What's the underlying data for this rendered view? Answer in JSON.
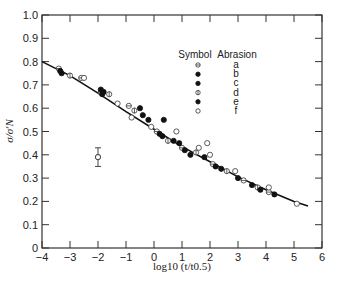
{
  "chart_data": {
    "type": "scatter",
    "title": "",
    "xlabel": "log10 (t/t0.5)",
    "ylabel": "σ/σ'N",
    "xlim": [
      -4,
      6
    ],
    "ylim": [
      0,
      1.0
    ],
    "grid": false,
    "x_ticks": [
      -4,
      -3,
      -2,
      -1,
      0,
      1,
      2,
      3,
      4,
      5,
      6
    ],
    "x_tick_labels": [
      "−4",
      "−3",
      "−2",
      "−1",
      "0",
      "1",
      "2",
      "3",
      "4",
      "5",
      "6"
    ],
    "y_ticks": [
      0,
      0.1,
      0.2,
      0.3,
      0.4,
      0.5,
      0.6,
      0.7,
      0.8,
      0.9,
      1.0
    ],
    "y_tick_labels": [
      "0",
      "0.1",
      "0.2",
      "0.3",
      "0.4",
      "0.5",
      "0.6",
      "0.7",
      "0.8",
      "0.9",
      "1.0"
    ],
    "legend": {
      "position": "upper right",
      "headers": [
        "Symbol",
        "Abrasion"
      ],
      "entries": [
        {
          "symbol": "circle-hbar",
          "label": "a"
        },
        {
          "symbol": "filled-circle",
          "label": "b"
        },
        {
          "symbol": "filled-circle",
          "label": "c"
        },
        {
          "symbol": "circle-vbar",
          "label": "d"
        },
        {
          "symbol": "filled-circle",
          "label": "e"
        },
        {
          "symbol": "open-circle",
          "label": "f"
        }
      ]
    },
    "fit_curve": {
      "x": [
        -4,
        -3,
        -2,
        -1,
        0,
        1,
        2,
        3,
        4,
        5,
        5.5
      ],
      "y": [
        0.8,
        0.74,
        0.665,
        0.585,
        0.51,
        0.435,
        0.37,
        0.305,
        0.25,
        0.2,
        0.18
      ]
    },
    "series": [
      {
        "name": "a",
        "symbol": "circle-hbar",
        "points": [
          [
            -3.4,
            0.77
          ],
          [
            -2.6,
            0.73
          ],
          [
            -1.9,
            0.67
          ],
          [
            -0.9,
            0.61
          ],
          [
            0.1,
            0.5
          ],
          [
            1.0,
            0.43
          ],
          [
            2.1,
            0.36
          ],
          [
            3.2,
            0.29
          ],
          [
            4.1,
            0.24
          ]
        ]
      },
      {
        "name": "b",
        "symbol": "filled-circle",
        "points": [
          [
            -3.3,
            0.75
          ],
          [
            -1.8,
            0.67
          ],
          [
            -0.5,
            0.6
          ],
          [
            0.2,
            0.49
          ],
          [
            0.9,
            0.45
          ],
          [
            2.2,
            0.35
          ],
          [
            3.0,
            0.3
          ],
          [
            4.3,
            0.23
          ]
        ]
      },
      {
        "name": "c",
        "symbol": "filled-circle",
        "points": [
          [
            -3.35,
            0.76
          ],
          [
            -1.85,
            0.66
          ],
          [
            -0.2,
            0.55
          ],
          [
            0.3,
            0.48
          ],
          [
            1.1,
            0.42
          ],
          [
            1.8,
            0.39
          ],
          [
            3.5,
            0.27
          ]
        ]
      },
      {
        "name": "d",
        "symbol": "circle-vbar",
        "points": [
          [
            -3.0,
            0.74
          ],
          [
            -1.6,
            0.66
          ],
          [
            -0.7,
            0.59
          ],
          [
            0.5,
            0.46
          ],
          [
            1.5,
            0.41
          ],
          [
            2.6,
            0.33
          ],
          [
            3.7,
            0.26
          ]
        ]
      },
      {
        "name": "e",
        "symbol": "filled-circle",
        "points": [
          [
            -1.9,
            0.68
          ],
          [
            -0.4,
            0.57
          ],
          [
            0.35,
            0.55
          ],
          [
            0.7,
            0.46
          ],
          [
            1.3,
            0.4
          ],
          [
            2.4,
            0.34
          ],
          [
            3.8,
            0.25
          ]
        ]
      },
      {
        "name": "f",
        "symbol": "open-circle",
        "points": [
          [
            -2.0,
            0.39
          ],
          [
            -2.5,
            0.73
          ],
          [
            -1.3,
            0.62
          ],
          [
            -0.8,
            0.56
          ],
          [
            -0.1,
            0.52
          ],
          [
            0.8,
            0.5
          ],
          [
            1.6,
            0.43
          ],
          [
            1.9,
            0.45
          ],
          [
            2.0,
            0.4
          ],
          [
            2.9,
            0.33
          ],
          [
            4.1,
            0.26
          ],
          [
            5.1,
            0.19
          ]
        ]
      }
    ],
    "error_bar": {
      "x": -2.0,
      "y": 0.39,
      "ymin": 0.35,
      "ymax": 0.43
    }
  }
}
